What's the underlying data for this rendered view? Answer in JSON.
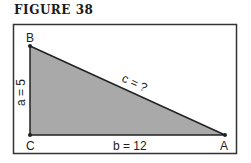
{
  "figure": {
    "title": "FIGURE 38"
  },
  "triangle": {
    "vertices": {
      "B": "B",
      "C": "C",
      "A": "A"
    },
    "sides": {
      "a": "a = 5",
      "b": "b = 12",
      "c": "c = ?"
    },
    "fill_color": "#a9a9a9",
    "stroke_color": "#222222"
  }
}
